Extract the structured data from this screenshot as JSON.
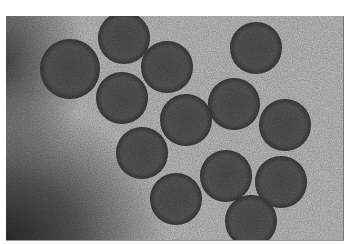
{
  "image": {
    "description": "Grayscale electron micrograph of spherical virus-like particles with spiky fringes",
    "colors": {
      "background": "#b9b9b9",
      "particle": "#4e4e4e",
      "dark_region": "#2a2a2a",
      "margin": "#ffffff"
    },
    "particles": [
      {
        "x": 64,
        "y": 53,
        "r": 22
      },
      {
        "x": 118,
        "y": 22,
        "r": 19
      },
      {
        "x": 161,
        "y": 51,
        "r": 19
      },
      {
        "x": 116,
        "y": 82,
        "r": 19
      },
      {
        "x": 250,
        "y": 32,
        "r": 19
      },
      {
        "x": 180,
        "y": 104,
        "r": 19
      },
      {
        "x": 228,
        "y": 88,
        "r": 19
      },
      {
        "x": 279,
        "y": 109,
        "r": 19
      },
      {
        "x": 136,
        "y": 137,
        "r": 19
      },
      {
        "x": 220,
        "y": 160,
        "r": 19
      },
      {
        "x": 170,
        "y": 183,
        "r": 19
      },
      {
        "x": 275,
        "y": 166,
        "r": 19
      },
      {
        "x": 245,
        "y": 205,
        "r": 19
      }
    ]
  }
}
